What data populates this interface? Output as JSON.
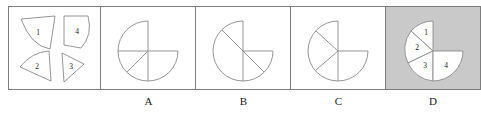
{
  "figure": {
    "type": "shape-assembly-multiple-choice",
    "panel_count": 5,
    "highlighted_option": "D",
    "colors": {
      "panel_border": "#7d7d7d",
      "shape_stroke": "#8a8a8a",
      "shape_fill": "#ffffff",
      "shaded_panel_background": "#c9c9c9",
      "page_background": "#ffffff",
      "label_text": "#1a1a1a"
    }
  },
  "pieces_panel": {
    "name": "pieces",
    "label": "",
    "pieces": [
      {
        "number": "1",
        "description": "rounded wedge, apex upper-left"
      },
      {
        "number": "4",
        "description": "quarter circle, rounded right corner"
      },
      {
        "number": "2",
        "description": "wedge, apex pointing left"
      },
      {
        "number": "3",
        "description": "wedge, apex pointing right"
      }
    ]
  },
  "options": [
    {
      "id": "A",
      "label": "A",
      "description": "circle missing upper-right quadrant with vertical, horizontal and one lower-left diagonal"
    },
    {
      "id": "B",
      "label": "B",
      "description": "circle missing upper-right quadrant with vertical line, right horizontal and a full diagonal"
    },
    {
      "id": "C",
      "label": "C",
      "description": "circle missing upper-right quadrant with vertical line, right horizontal and two left diagonals"
    },
    {
      "id": "D",
      "label": "D",
      "description": "shaded panel: assembled circle missing upper-right quadrant with pieces labelled 1, 2, 3, 4",
      "shaded": true,
      "piece_labels": [
        "1",
        "2",
        "3",
        "4"
      ]
    }
  ]
}
